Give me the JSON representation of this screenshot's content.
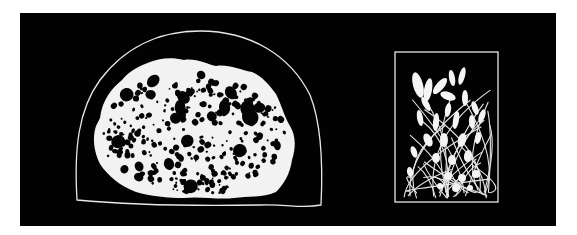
{
  "figure": {
    "background_color": "#000000",
    "foreground_color": "#f2f2f2",
    "page_color": "#ffffff",
    "panel": {
      "x": 20,
      "y": 13,
      "width": 536,
      "height": 213
    }
  },
  "left_specimen": {
    "label": "porous sponge-like mass",
    "enclosure": "dome outline",
    "dome": {
      "left": 77,
      "right": 322,
      "top": 31,
      "bottom_left_y": 200,
      "bottom_right_y": 206
    },
    "mass_bounds": {
      "x1": 92,
      "y1": 58,
      "x2": 296,
      "y2": 198
    }
  },
  "right_specimen": {
    "label": "cluster of club-shaped bodies on thread-like stalks",
    "enclosure": "rectangle outline",
    "frame": {
      "x": 395,
      "y": 52,
      "width": 103,
      "height": 150
    }
  }
}
